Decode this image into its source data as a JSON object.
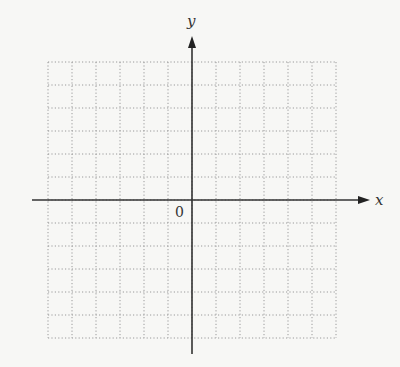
{
  "figure": {
    "type": "coordinate-plane",
    "x_axis_label": "x",
    "y_axis_label": "y",
    "origin_label": "0",
    "grid": {
      "columns": 12,
      "rows": 12,
      "style": "dotted",
      "color": "#9a9a9a"
    },
    "axis_color": "#333333",
    "background": "#f7f7f5"
  }
}
